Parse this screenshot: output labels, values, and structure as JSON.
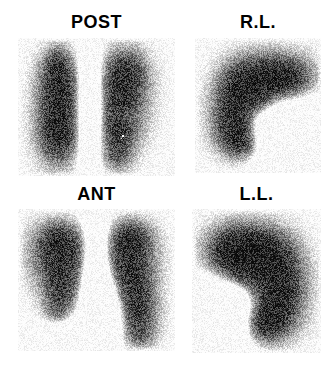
{
  "figure": {
    "modality": "nuclear-medicine-scintigraphy",
    "background_color": "#ffffff",
    "label_color": "#000000",
    "grid": {
      "rows": 2,
      "cols": 2
    }
  },
  "panels": [
    {
      "id": "post",
      "label": "POST",
      "view_name": "posterior",
      "structures": 2,
      "description": "Two vertically elongated lung fields, posterior projection",
      "hotspot": true
    },
    {
      "id": "rl",
      "label": "R.L.",
      "view_name": "right-lateral",
      "structures": 1,
      "description": "Single comma shaped lung field, right lateral projection",
      "hotspot": false
    },
    {
      "id": "ant",
      "label": "ANT",
      "view_name": "anterior",
      "structures": 2,
      "description": "Two lung fields with central cardiac notch, anterior projection",
      "hotspot": false
    },
    {
      "id": "ll",
      "label": "L.L.",
      "view_name": "left-lateral",
      "structures": 1,
      "description": "Single lung field with inferior notch, left lateral projection",
      "hotspot": false
    }
  ],
  "render": {
    "blob_max_darkness": "#101010",
    "panel_base_color": "#fdfdfd",
    "noise_amount": 0.42
  }
}
